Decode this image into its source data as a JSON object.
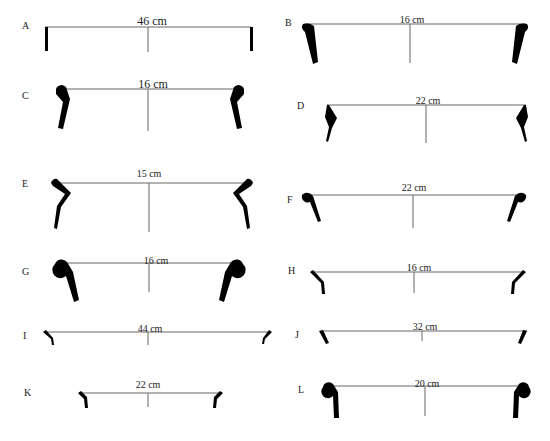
{
  "figure": {
    "type": "pottery rim profile drawings",
    "profiles": [
      {
        "label": "A",
        "diameter": "46 cm"
      },
      {
        "label": "B",
        "diameter": "16 cm"
      },
      {
        "label": "C",
        "diameter": "16 cm"
      },
      {
        "label": "D",
        "diameter": "22 cm"
      },
      {
        "label": "E",
        "diameter": "15 cm"
      },
      {
        "label": "F",
        "diameter": "22 cm"
      },
      {
        "label": "G",
        "diameter": "16 cm"
      },
      {
        "label": "H",
        "diameter": "16 cm"
      },
      {
        "label": "I",
        "diameter": "44 cm"
      },
      {
        "label": "J",
        "diameter": "32 cm"
      },
      {
        "label": "K",
        "diameter": "22 cm"
      },
      {
        "label": "L",
        "diameter": "20 cm"
      }
    ]
  },
  "colors": {
    "profile_fill": "#000000",
    "line": "#555555",
    "background": "#ffffff"
  }
}
